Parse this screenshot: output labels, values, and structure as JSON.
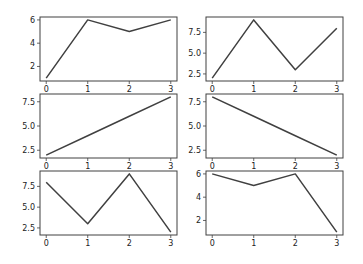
{
  "figure": {
    "width": 363,
    "height": 264,
    "background": "#ffffff",
    "line_color": "#404040",
    "axes_color": "#404040"
  },
  "chart_data": [
    {
      "type": "line",
      "position": "row1-col1",
      "x": [
        0,
        1,
        2,
        3
      ],
      "y": [
        1,
        6,
        5,
        6
      ],
      "xticks": [
        "0",
        "1",
        "2",
        "3"
      ],
      "yticks": [
        "2",
        "4",
        "6"
      ],
      "ytick_values": [
        2,
        4,
        6
      ],
      "ylim": [
        0.75,
        6.25
      ],
      "xlim": [
        -0.15,
        3.15
      ],
      "title": "",
      "xlabel": "",
      "ylabel": "",
      "grid": false
    },
    {
      "type": "line",
      "position": "row1-col2",
      "x": [
        0,
        1,
        2,
        3
      ],
      "y": [
        2,
        9,
        3,
        8
      ],
      "xticks": [
        "0",
        "1",
        "2",
        "3"
      ],
      "yticks": [
        "2.5",
        "5.0",
        "7.5"
      ],
      "ytick_values": [
        2.5,
        5.0,
        7.5
      ],
      "ylim": [
        1.65,
        9.35
      ],
      "xlim": [
        -0.15,
        3.15
      ],
      "title": "",
      "xlabel": "",
      "ylabel": "",
      "grid": false
    },
    {
      "type": "line",
      "position": "row2-col1",
      "x": [
        0,
        1,
        2,
        3
      ],
      "y": [
        2,
        4,
        6,
        8
      ],
      "xticks": [
        "0",
        "1",
        "2",
        "3"
      ],
      "yticks": [
        "2.5",
        "5.0",
        "7.5"
      ],
      "ytick_values": [
        2.5,
        5.0,
        7.5
      ],
      "ylim": [
        1.7,
        8.3
      ],
      "xlim": [
        -0.15,
        3.15
      ],
      "title": "",
      "xlabel": "",
      "ylabel": "",
      "grid": false
    },
    {
      "type": "line",
      "position": "row2-col2",
      "x": [
        0,
        1,
        2,
        3
      ],
      "y": [
        8,
        6,
        4,
        2
      ],
      "xticks": [
        "0",
        "1",
        "2",
        "3"
      ],
      "yticks": [
        "2.5",
        "5.0",
        "7.5"
      ],
      "ytick_values": [
        2.5,
        5.0,
        7.5
      ],
      "ylim": [
        1.7,
        8.3
      ],
      "xlim": [
        -0.15,
        3.15
      ],
      "title": "",
      "xlabel": "",
      "ylabel": "",
      "grid": false
    },
    {
      "type": "line",
      "position": "row3-col1",
      "x": [
        0,
        1,
        2,
        3
      ],
      "y": [
        8,
        3,
        9,
        2
      ],
      "xticks": [
        "0",
        "1",
        "2",
        "3"
      ],
      "yticks": [
        "2.5",
        "5.0",
        "7.5"
      ],
      "ytick_values": [
        2.5,
        5.0,
        7.5
      ],
      "ylim": [
        1.65,
        9.35
      ],
      "xlim": [
        -0.15,
        3.15
      ],
      "title": "",
      "xlabel": "",
      "ylabel": "",
      "grid": false
    },
    {
      "type": "line",
      "position": "row3-col2",
      "x": [
        0,
        1,
        2,
        3
      ],
      "y": [
        6,
        5,
        6,
        1
      ],
      "xticks": [
        "0",
        "1",
        "2",
        "3"
      ],
      "yticks": [
        "2",
        "4",
        "6"
      ],
      "ytick_values": [
        2,
        4,
        6
      ],
      "ylim": [
        0.75,
        6.25
      ],
      "xlim": [
        -0.15,
        3.15
      ],
      "title": "",
      "xlabel": "",
      "ylabel": "",
      "grid": false
    }
  ]
}
